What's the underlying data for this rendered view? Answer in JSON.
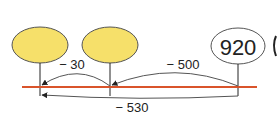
{
  "diagram": {
    "type": "number-line-subtraction",
    "nodes": [
      {
        "id": "blank-1",
        "value": "",
        "fill": "#f6e06a"
      },
      {
        "id": "blank-2",
        "value": "",
        "fill": "#f6e06a"
      },
      {
        "id": "start",
        "value": "920",
        "fill": "#ffffff"
      }
    ],
    "steps": [
      {
        "label": "− 500",
        "from": "start",
        "to": "blank-2"
      },
      {
        "label": "− 30",
        "from": "blank-2",
        "to": "blank-1"
      }
    ],
    "total": {
      "label": "− 530",
      "from": "start",
      "to": "blank-1"
    },
    "colors": {
      "number_line": "#d9542b",
      "ellipse_fill": "#f6e06a",
      "stroke": "#555555"
    }
  }
}
